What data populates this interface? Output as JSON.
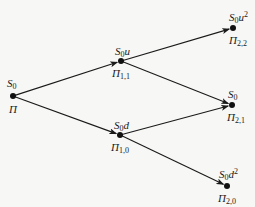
{
  "diagram": {
    "type": "binomial-tree",
    "nodes": [
      {
        "id": "root",
        "x": 13,
        "y": 96,
        "price_base": "S",
        "price_sub": "0",
        "price_suffix": "",
        "price_sup": "",
        "value_base": "Π",
        "value_sub": ""
      },
      {
        "id": "n11",
        "x": 121,
        "y": 61,
        "price_base": "S",
        "price_sub": "0",
        "price_suffix": "u",
        "price_sup": "",
        "value_base": "Π",
        "value_sub": "1,1"
      },
      {
        "id": "n10",
        "x": 120,
        "y": 135,
        "price_base": "S",
        "price_sub": "0",
        "price_suffix": "d",
        "price_sup": "",
        "value_base": "Π",
        "value_sub": "1,0"
      },
      {
        "id": "n22",
        "x": 233,
        "y": 28,
        "price_base": "S",
        "price_sub": "0",
        "price_suffix": "u",
        "price_sup": "2",
        "value_base": "Π",
        "value_sub": "2,2"
      },
      {
        "id": "n21",
        "x": 232,
        "y": 105,
        "price_base": "S",
        "price_sub": "0",
        "price_suffix": "",
        "price_sup": "",
        "value_base": "Π",
        "value_sub": "2,1"
      },
      {
        "id": "n20",
        "x": 227,
        "y": 186,
        "price_base": "S",
        "price_sub": "0",
        "price_suffix": "d",
        "price_sup": "2",
        "value_base": "Π",
        "value_sub": "2,0"
      }
    ],
    "edges": [
      {
        "from": "root",
        "to": "n11"
      },
      {
        "from": "root",
        "to": "n10"
      },
      {
        "from": "n11",
        "to": "n22"
      },
      {
        "from": "n11",
        "to": "n21"
      },
      {
        "from": "n10",
        "to": "n21"
      },
      {
        "from": "n10",
        "to": "n20"
      }
    ],
    "colors": {
      "line": "#1a1a1a",
      "node": "#111111",
      "background": "#f7f7f5"
    }
  }
}
